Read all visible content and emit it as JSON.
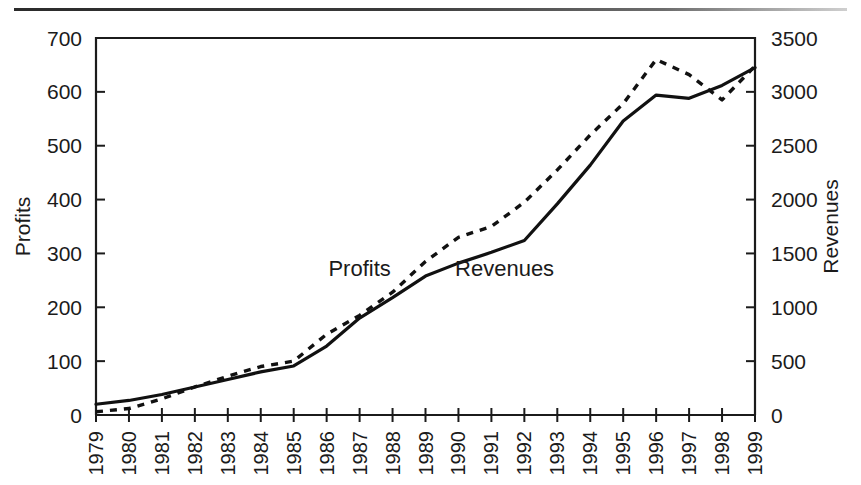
{
  "chart_data": {
    "type": "line",
    "title": "",
    "xlabel": "",
    "ylabel": "Profits",
    "y2label": "Revenues",
    "grid": false,
    "legend_position": "inline-annotations",
    "x": [
      1979,
      1980,
      1981,
      1982,
      1983,
      1984,
      1985,
      1986,
      1987,
      1988,
      1989,
      1990,
      1991,
      1992,
      1993,
      1994,
      1995,
      1996,
      1997,
      1998,
      1999
    ],
    "xticklabels": [
      "1979",
      "1980",
      "1981",
      "1982",
      "1983",
      "1984",
      "1985",
      "1986",
      "1987",
      "1988",
      "1989",
      "1990",
      "1991",
      "1992",
      "1993",
      "1994",
      "1995",
      "1996",
      "1997",
      "1998",
      "1999"
    ],
    "ylim": [
      0,
      700
    ],
    "yticks": [
      0,
      100,
      200,
      300,
      400,
      500,
      600,
      700
    ],
    "yticklabels": [
      "0",
      "100",
      "200",
      "300",
      "400",
      "500",
      "600",
      "700"
    ],
    "y2lim": [
      0,
      3500
    ],
    "y2ticks": [
      0,
      500,
      1000,
      1500,
      2000,
      2500,
      3000,
      3500
    ],
    "y2ticklabels": [
      "0",
      "500",
      "1000",
      "1500",
      "2000",
      "2500",
      "3000",
      "3500"
    ],
    "series": [
      {
        "name": "Profits",
        "axis": "left",
        "style": "dashed",
        "label_text": "Profits",
        "label_x": 1987.0,
        "label_y": 258,
        "values": [
          6,
          12,
          30,
          52,
          72,
          90,
          100,
          150,
          185,
          228,
          285,
          330,
          350,
          395,
          455,
          520,
          578,
          660,
          632,
          585,
          648
        ]
      },
      {
        "name": "Revenues",
        "axis": "right",
        "style": "solid",
        "label_text": "Revenues",
        "label_x": 1991.4,
        "label_y": 258,
        "values_right_axis": [
          100,
          135,
          190,
          260,
          330,
          400,
          455,
          640,
          900,
          1090,
          1290,
          1410,
          1510,
          1620,
          1960,
          2320,
          2730,
          2970,
          2940,
          3060,
          3225
        ],
        "values_left_scale": [
          20,
          27,
          38,
          52,
          66,
          80,
          91,
          128,
          180,
          218,
          258,
          282,
          302,
          324,
          392,
          464,
          546,
          594,
          588,
          612,
          645
        ]
      }
    ],
    "colors": {
      "line": "#111111",
      "axis": "#1b1b1b",
      "background": "#ffffff"
    }
  },
  "annotations": {
    "scan_artifact_top_border": true
  }
}
